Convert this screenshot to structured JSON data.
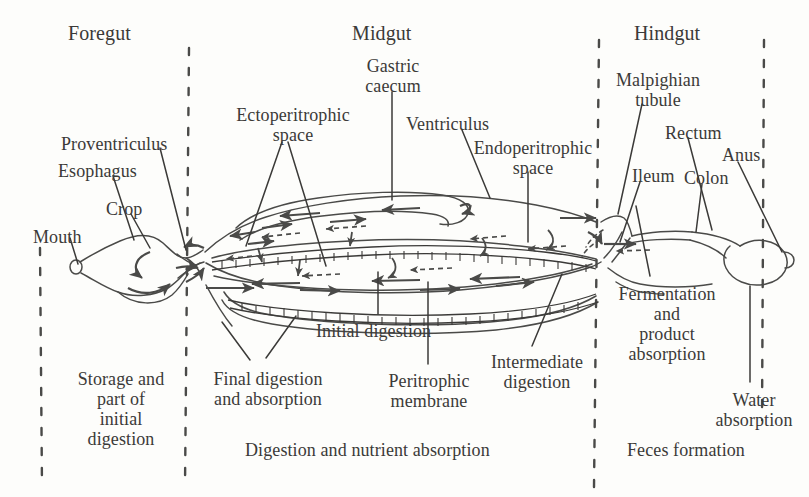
{
  "figure": {
    "background_color": "#fdfdfb",
    "ink_color": "#3b3a38",
    "line_color": "#4a4a48"
  },
  "sections": [
    {
      "id": "foregut",
      "label": "Foregut",
      "x": 68,
      "y": 22
    },
    {
      "id": "midgut",
      "label": "Midgut",
      "x": 352,
      "y": 22
    },
    {
      "id": "hindgut",
      "label": "Hindgut",
      "x": 634,
      "y": 22
    }
  ],
  "dividers": [
    {
      "id": "divider-left-edge",
      "x": 40,
      "y1": 248,
      "y2": 487
    },
    {
      "id": "divider-foregut-midgut",
      "x": 188,
      "y1": 48,
      "y2": 487
    },
    {
      "id": "divider-midgut-hindgut",
      "x": 597,
      "y1": 40,
      "y2": 487
    },
    {
      "id": "divider-right-edge",
      "x": 763,
      "y1": 40,
      "y2": 420
    }
  ],
  "parts": [
    {
      "id": "mouth",
      "label": "Mouth",
      "x": 33,
      "y": 227
    },
    {
      "id": "esophagus",
      "label": "Esophagus",
      "x": 58,
      "y": 161
    },
    {
      "id": "proventriculus",
      "label": "Proventriculus",
      "x": 61,
      "y": 134
    },
    {
      "id": "crop",
      "label": "Crop",
      "x": 106,
      "y": 199
    },
    {
      "id": "ectoperitrophic-space",
      "label": "Ectoperitrophic\nspace",
      "x": 228,
      "y": 105
    },
    {
      "id": "gastric-caecum",
      "label": "Gastric\ncaecum",
      "x": 360,
      "y": 56
    },
    {
      "id": "ventriculus",
      "label": "Ventriculus",
      "x": 406,
      "y": 114
    },
    {
      "id": "endoperitrophic-space",
      "label": "Endoperitrophic\nspace",
      "x": 470,
      "y": 138
    },
    {
      "id": "malpighian-tubule",
      "label": "Malpighian\ntubule",
      "x": 612,
      "y": 70
    },
    {
      "id": "rectum",
      "label": "Rectum",
      "x": 665,
      "y": 123
    },
    {
      "id": "anus",
      "label": "Anus",
      "x": 722,
      "y": 145
    },
    {
      "id": "ileum",
      "label": "Ileum",
      "x": 632,
      "y": 166
    },
    {
      "id": "colon",
      "label": "Colon",
      "x": 684,
      "y": 168
    }
  ],
  "captions": [
    {
      "id": "storage-initial-digestion",
      "label": "Storage and\npart of\ninitial\ndigestion",
      "x": 70,
      "y": 369,
      "align": "center",
      "width": 110
    },
    {
      "id": "final-digestion-absorption",
      "label": "Final digestion\nand absorption",
      "x": 205,
      "y": 369,
      "align": "center",
      "width": 128
    },
    {
      "id": "initial-digestion",
      "label": "Initial digestion",
      "x": 316,
      "y": 321,
      "align": "left",
      "width": 150
    },
    {
      "id": "peritrophic-membrane",
      "label": "Peritrophic\nmembrane",
      "x": 372,
      "y": 371,
      "align": "center",
      "width": 110
    },
    {
      "id": "intermediate-digestion",
      "label": "Intermediate\ndigestion",
      "x": 481,
      "y": 352,
      "align": "center",
      "width": 112
    },
    {
      "id": "digestion-nutrient-absorption",
      "label": "Digestion and nutrient absorption",
      "x": 245,
      "y": 440,
      "align": "left",
      "width": 330
    },
    {
      "id": "fermentation-product-absorption",
      "label": "Fermentation\nand\nproduct\nabsorption",
      "x": 613,
      "y": 284,
      "align": "center",
      "width": 112
    },
    {
      "id": "water-absorption",
      "label": "Water\nabsorption",
      "x": 706,
      "y": 390,
      "align": "center",
      "width": 96
    },
    {
      "id": "feces-formation",
      "label": "Feces formation",
      "x": 627,
      "y": 440,
      "align": "left",
      "width": 160
    }
  ],
  "anatomy_notes": {
    "foregut": "Mouth opens to a narrow esophagus that widens into the bulbous crop, then narrows at the proventriculus.",
    "midgut": "Long tubular ventriculus lined internally by the peritrophic membrane, separating endoperitrophic (inner) from ectoperitrophic (outer) space; gastric caeca loop at the anterior end.",
    "hindgut": "Malpighian tubules join at the midgut–hindgut junction; ileum leads to colon then to the enlarged rectum ending at the anus.",
    "flow": "Solid arrows show bulk food movement posteriorly; counter-current arrows in the ectoperitrophic space show fluid moving anteriorly."
  }
}
